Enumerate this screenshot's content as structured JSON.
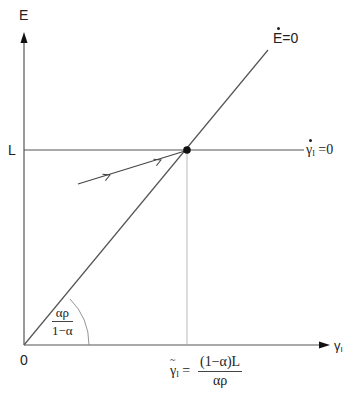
{
  "diagram": {
    "type": "phase-diagram",
    "axes": {
      "y_label": "E",
      "x_label": "γ",
      "x_label_sub": "I",
      "origin_label": "0"
    },
    "lines": {
      "e_dot_zero": {
        "label_main": "E",
        "label_rest": "=0"
      },
      "gamma_dot_zero": {
        "label_main": "γ",
        "label_sub": "I",
        "label_rest": " =0"
      }
    },
    "y_tick": {
      "label": "L"
    },
    "angle": {
      "numerator": "αρ",
      "denominator": "1−α"
    },
    "steady_state": {
      "lhs_main": "γ",
      "lhs_sub": "I",
      "equals": "=",
      "numerator": "(1−α)L",
      "denominator": "αρ"
    },
    "colors": {
      "line": "#555555",
      "dot": "#111111",
      "text": "#222222"
    }
  }
}
